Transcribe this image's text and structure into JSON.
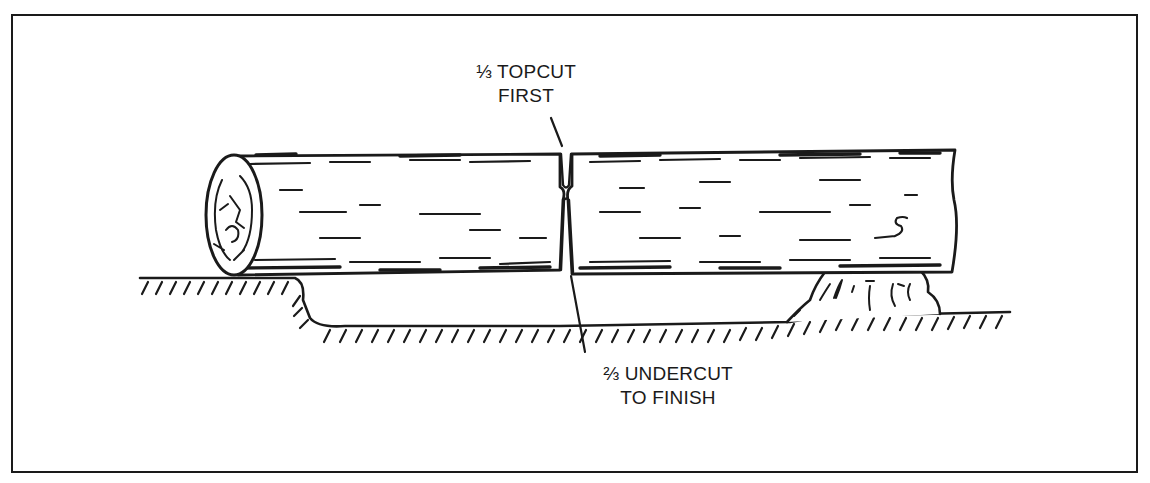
{
  "diagram": {
    "labels": {
      "topcut": {
        "line1": "⅓ TOPCUT",
        "line2": "FIRST"
      },
      "undercut": {
        "line1": "⅔ UNDERCUT",
        "line2": "TO FINISH"
      }
    },
    "elements": [
      "log",
      "log-end-grain",
      "ground-line",
      "hollow-depression",
      "support-rock",
      "topcut-kerf",
      "undercut-kerf",
      "leader-lines"
    ],
    "colors": {
      "ink": "#1a1a1a",
      "paper": "#ffffff"
    }
  }
}
